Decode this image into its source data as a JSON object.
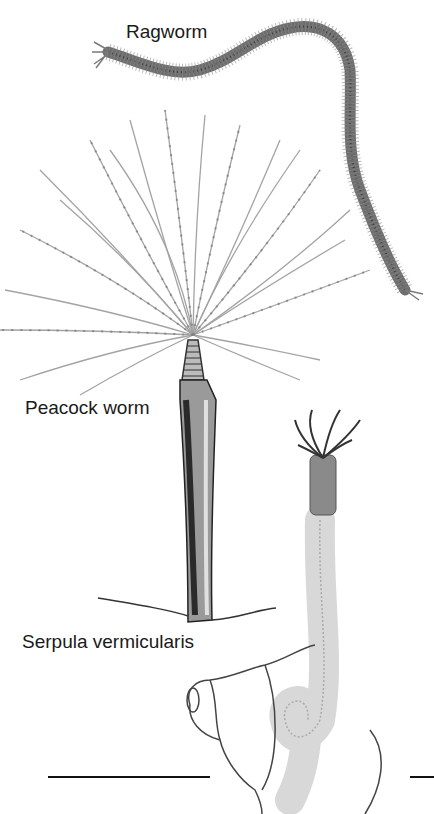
{
  "illustration": {
    "labels": {
      "ragworm": "Ragworm",
      "peacock_worm": "Peacock worm",
      "serpula": "Serpula vermicularis"
    },
    "colors": {
      "ink": "#2a2a2a",
      "worm_body": "#6e6e6e",
      "fan": "#9a9a9a",
      "tube_dark": "#3c3c3c",
      "tube_light": "#cfcfcf"
    }
  }
}
